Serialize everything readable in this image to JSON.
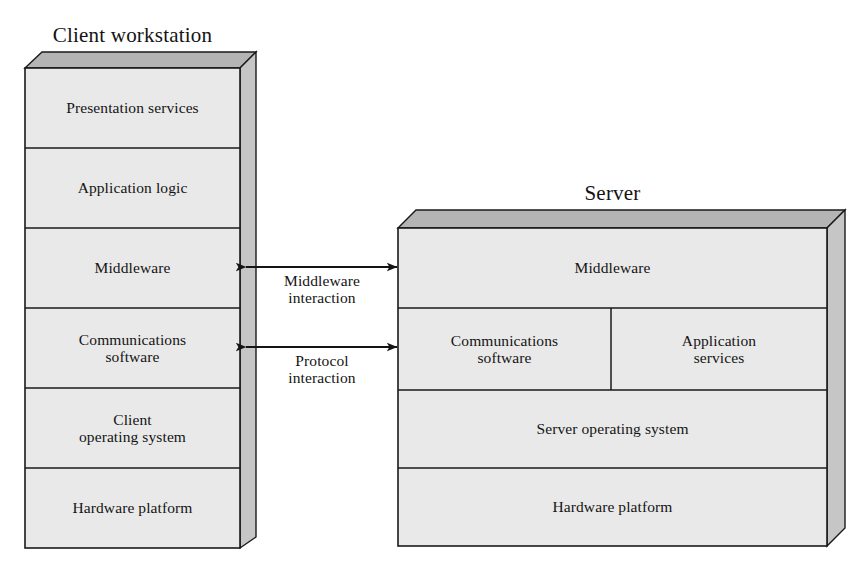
{
  "diagram": {
    "background_color": "#ffffff",
    "face_fill": "#e9e9e9",
    "top_fill": "#b4b4b4",
    "side_fill": "#c6c6c6",
    "stroke_color": "#1a1a1a"
  },
  "client": {
    "title": "Client workstation",
    "layers": [
      {
        "label": "Presentation services"
      },
      {
        "label": "Application logic"
      },
      {
        "label": "Middleware"
      },
      {
        "label": "Communications\nsoftware"
      },
      {
        "label": "Client\noperating system"
      },
      {
        "label": "Hardware platform"
      }
    ]
  },
  "server": {
    "title": "Server",
    "layers": [
      {
        "label": "Middleware"
      },
      {
        "label": "Communications\nsoftware"
      },
      {
        "label": "Application\nservices"
      },
      {
        "label": "Server operating system"
      },
      {
        "label": "Hardware platform"
      }
    ]
  },
  "connectors": [
    {
      "name": "middleware-interaction",
      "label": "Middleware\ninteraction",
      "style": "double-headed-arrow"
    },
    {
      "name": "protocol-interaction",
      "label": "Protocol\ninteraction",
      "style": "double-headed-arrow"
    }
  ]
}
